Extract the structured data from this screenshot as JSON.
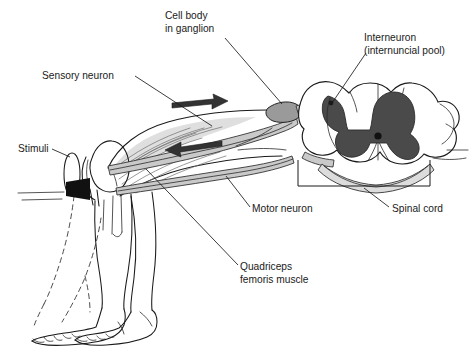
{
  "figure": {
    "background_color": "#ffffff",
    "width": 470,
    "height": 349
  },
  "colors": {
    "ink": "#1a1a1a",
    "gray_matter": "#4a4a4a",
    "nerve_sheath": "#c9c9c9",
    "white_matter": "#ffffff",
    "muscle_shade": "#b8b8b8",
    "hammer_head": "#111111",
    "arrow": "#333333"
  },
  "labels": [
    {
      "name": "cell-body-in-ganglion",
      "lines": [
        "Cell body",
        "in ganglion"
      ],
      "x": 165,
      "y": 19
    },
    {
      "name": "interneuron",
      "lines": [
        "Interneuron",
        "(internuncial pool)"
      ],
      "x": 364,
      "y": 41
    },
    {
      "name": "sensory-neuron",
      "lines": [
        "Sensory neuron"
      ],
      "x": 42,
      "y": 79
    },
    {
      "name": "stimuli",
      "lines": [
        "Stimuli"
      ],
      "x": 18,
      "y": 152
    },
    {
      "name": "motor-neuron",
      "lines": [
        "Motor neuron"
      ],
      "x": 252,
      "y": 212
    },
    {
      "name": "spinal-cord",
      "lines": [
        "Spinal cord"
      ],
      "x": 392,
      "y": 212
    },
    {
      "name": "quadriceps-femoris-muscle",
      "lines": [
        "Quadriceps",
        "femoris muscle"
      ],
      "x": 240,
      "y": 270
    }
  ],
  "anatomy": {
    "spinal_cord": {
      "label": "Spinal cord",
      "gray_matter_shape": "butterfly",
      "central_canal": "present"
    },
    "ganglion": {
      "label": "Cell body in ganglion",
      "position": "dorsal root"
    },
    "interneuron": {
      "label": "Interneuron (internuncial pool)",
      "position": "dorsal horn"
    },
    "leg": {
      "state_resting": "solid outline",
      "state_kicking": "dashed outline"
    },
    "hammer": {
      "name": "reflex hammer",
      "target": "patellar tendon"
    }
  },
  "arrows": [
    {
      "name": "afferent-arrow",
      "direction": "right",
      "meaning": "sensory impulse toward cord"
    },
    {
      "name": "efferent-arrow",
      "direction": "left",
      "meaning": "motor impulse toward muscle"
    }
  ]
}
